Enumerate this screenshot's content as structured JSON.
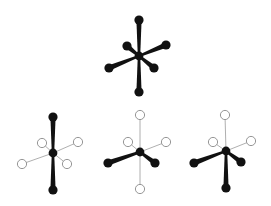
{
  "diagram": {
    "title": "",
    "colors": {
      "filled": "#111111",
      "open_stroke": "#8a8a8a",
      "thin_bond": "#9a9a9a",
      "background": "#ffffff"
    },
    "molecules": [
      {
        "name": "full-octahedron",
        "center": [
          139,
          56
        ],
        "ligands": [
          {
            "pos": [
              139,
              20
            ],
            "filled": true
          },
          {
            "pos": [
              127,
              46
            ],
            "filled": true
          },
          {
            "pos": [
              166,
              45
            ],
            "filled": true
          },
          {
            "pos": [
              109,
              68
            ],
            "filled": true
          },
          {
            "pos": [
              154,
              68
            ],
            "filled": true
          },
          {
            "pos": [
              139,
              92
            ],
            "filled": true
          }
        ]
      },
      {
        "name": "axial-pair",
        "center": [
          53,
          153
        ],
        "ligands": [
          {
            "pos": [
              53,
              117
            ],
            "filled": true
          },
          {
            "pos": [
              42,
              143
            ],
            "filled": false
          },
          {
            "pos": [
              78,
              142
            ],
            "filled": false
          },
          {
            "pos": [
              22,
              164
            ],
            "filled": false
          },
          {
            "pos": [
              67,
              164
            ],
            "filled": false
          },
          {
            "pos": [
              53,
              190
            ],
            "filled": true
          }
        ]
      },
      {
        "name": "cis-equatorial-pair",
        "center": [
          140,
          152
        ],
        "ligands": [
          {
            "pos": [
              140,
              115
            ],
            "filled": false
          },
          {
            "pos": [
              128,
              142
            ],
            "filled": false
          },
          {
            "pos": [
              166,
              142
            ],
            "filled": false
          },
          {
            "pos": [
              108,
              163
            ],
            "filled": true
          },
          {
            "pos": [
              155,
              163
            ],
            "filled": true
          },
          {
            "pos": [
              140,
              189
            ],
            "filled": false
          }
        ]
      },
      {
        "name": "fac-triple",
        "center": [
          226,
          151
        ],
        "ligands": [
          {
            "pos": [
              225,
              115
            ],
            "filled": false
          },
          {
            "pos": [
              213,
              142
            ],
            "filled": false
          },
          {
            "pos": [
              251,
              141
            ],
            "filled": false
          },
          {
            "pos": [
              194,
              163
            ],
            "filled": true
          },
          {
            "pos": [
              241,
              162
            ],
            "filled": true
          },
          {
            "pos": [
              226,
              188
            ],
            "filled": true
          }
        ]
      }
    ]
  }
}
